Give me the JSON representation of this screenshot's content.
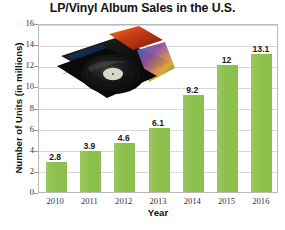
{
  "chart_data": {
    "type": "bar",
    "title": "LP/Vinyl Album Sales in the U.S.",
    "xlabel": "Year",
    "ylabel": "Number of Units (in millions)",
    "categories": [
      "2010",
      "2011",
      "2012",
      "2013",
      "2014",
      "2015",
      "2016"
    ],
    "values": [
      2.8,
      3.9,
      4.6,
      6.1,
      9.2,
      12,
      13.1
    ],
    "value_labels": [
      "2.8",
      "3.9",
      "4.6",
      "6.1",
      "9.2",
      "12",
      "13.1"
    ],
    "ylim": [
      0,
      16
    ],
    "yticks": [
      0,
      2,
      4,
      6,
      8,
      10,
      12,
      14,
      16
    ],
    "ytick_labels": [
      "0",
      "2",
      "4",
      "6",
      "8",
      "10",
      "12",
      "14",
      "16"
    ],
    "grid": true,
    "grid_axis": "y",
    "legend": false,
    "bar_color": "#8CC04C",
    "grid_color": "#D8D8D8",
    "axis_color": "#B9B9B9",
    "text_color": "#111111"
  },
  "overlay": {
    "image_name": "vinyl-records-photo",
    "description": "photograph of vinyl LP record and album sleeves"
  },
  "footer": {
    "source_note": ""
  }
}
